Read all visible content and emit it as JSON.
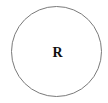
{
  "diagram": {
    "node": {
      "label": "R",
      "shape": "circle",
      "stroke_color": "#7a7a7a",
      "fill_color": "#ffffff"
    }
  }
}
